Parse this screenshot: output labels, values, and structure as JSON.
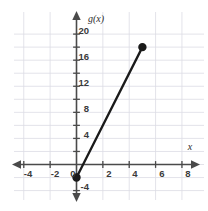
{
  "chart_data": {
    "type": "line",
    "title": "",
    "subtitle": "",
    "xlabel": "x",
    "ylabel": "g(x)",
    "xlim": [
      -5.2,
      9.2
    ],
    "ylim": [
      -5.2,
      21.4
    ],
    "grid": true,
    "grid_step": 2,
    "legend": "none",
    "x_tick_values": [
      -4,
      -2,
      0,
      2,
      4,
      6,
      8
    ],
    "x_tick_labels": [
      "-4",
      "-2",
      "0",
      "2",
      "4",
      "6",
      "8"
    ],
    "x_minor_ticks": [
      -4,
      -2,
      0,
      2,
      4,
      6,
      8
    ],
    "y_tick_values": [
      -4,
      4,
      8,
      12,
      16,
      20
    ],
    "y_tick_labels": [
      "-4",
      "4",
      "8",
      "12",
      "16",
      "20"
    ],
    "y_minor_ticks": [
      -4,
      -2,
      2,
      4,
      6,
      8,
      10,
      12,
      14,
      16,
      18,
      20
    ],
    "origin_label": "0",
    "series": [
      {
        "name": "g(x)",
        "type": "segment",
        "color": "#1a1a1a",
        "points": [
          {
            "x": 0,
            "y": -2
          },
          {
            "x": 5,
            "y": 18
          }
        ],
        "endpoints": [
          {
            "x": 0,
            "y": -2,
            "style": "filled"
          },
          {
            "x": 5,
            "y": 18,
            "style": "filled"
          }
        ],
        "slope": 4,
        "intercept": -2
      }
    ],
    "colors": {
      "grid": "#dcdce4",
      "axis": "#4a4a4a",
      "line": "#1a1a1a",
      "text": "#3a3a3a",
      "background": "#ffffff"
    }
  },
  "labels": {
    "y_axis_name": "g(x)",
    "x_axis_name": "x",
    "origin": "0",
    "y_20": "20",
    "y_16": "16",
    "y_12": "12",
    "y_8": "8",
    "y_4": "4",
    "y_neg4": "-4",
    "x_neg4": "-4",
    "x_neg2": "-2",
    "x_2": "2",
    "x_4": "4",
    "x_6": "6",
    "x_8": "8"
  }
}
